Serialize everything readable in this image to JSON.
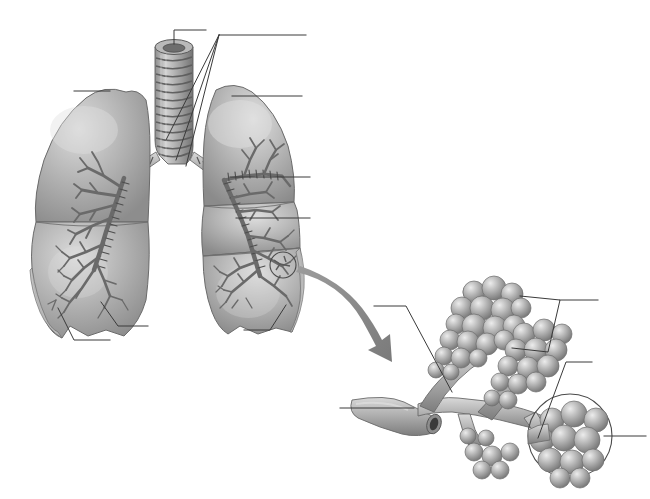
{
  "figure": {
    "style": "grayscale medical illustration, unlabeled worksheet",
    "background_color": "#ffffff",
    "width": 650,
    "height": 499,
    "cropped_header_text": "",
    "palette": {
      "lung_light": "#cfcfcf",
      "lung_mid": "#a9a9a9",
      "lung_shadow": "#7e7e7e",
      "bronchi": "#6f6f6f",
      "cartilage_light": "#c4c4c4",
      "cartilage_dark": "#6a6a6a",
      "alveoli_light": "#d8d8d8",
      "alveoli_mid": "#a5a5a5",
      "alveoli_shadow": "#777777",
      "leader_line": "#3a3a3a",
      "arrow": "#8a8a8a",
      "outline": "#555555"
    }
  },
  "panels": [
    {
      "id": "lungs-panel",
      "name": "Lungs with trachea and bronchial tree",
      "region": "left"
    },
    {
      "id": "alveoli-panel",
      "name": "Magnified alveolar sac cluster",
      "region": "lower-right"
    }
  ],
  "structures": {
    "trachea": "trachea with cartilage rings",
    "carina": "tracheal bifurcation",
    "primary_bronchus_left": "left primary bronchus",
    "primary_bronchus_right": "right primary bronchus",
    "left_lung": "left lung, two lobes",
    "right_lung": "right lung, three lobes",
    "bronchial_tree": "branching bronchi and bronchioles",
    "terminal_bronchiole": "terminal bronchiole",
    "alveolar_duct": "alveolar duct",
    "alveolar_sac": "alveolar sac",
    "alveoli": "alveoli cluster",
    "pulmonary_vessel": "pulmonary vessel stump"
  },
  "callouts": [
    {
      "id": "c1",
      "label": "",
      "target": "trachea-top",
      "style": "vertical-stub",
      "panel": "lungs-panel"
    },
    {
      "id": "c2",
      "label": "",
      "target": "bronchi-converging",
      "style": "converging-3",
      "panel": "lungs-panel"
    },
    {
      "id": "c3",
      "label": "",
      "target": "left-lung-apex",
      "style": "horizontal-left",
      "panel": "lungs-panel"
    },
    {
      "id": "c4",
      "label": "",
      "target": "right-lung-apex",
      "style": "horizontal-right",
      "panel": "lungs-panel"
    },
    {
      "id": "c5",
      "label": "",
      "target": "right-lung-bronchus-mid",
      "style": "horizontal-right",
      "panel": "lungs-panel"
    },
    {
      "id": "c6",
      "label": "",
      "target": "right-lung-bronchiole",
      "style": "horizontal-right",
      "panel": "lungs-panel"
    },
    {
      "id": "c7",
      "label": "",
      "target": "left-lung-base-lateral",
      "style": "diagonal-down",
      "panel": "lungs-panel"
    },
    {
      "id": "c8",
      "label": "",
      "target": "left-lung-base-medial",
      "style": "diagonal-down",
      "panel": "lungs-panel"
    },
    {
      "id": "c9",
      "label": "",
      "target": "right-lung-base",
      "style": "diagonal-down",
      "panel": "lungs-panel"
    },
    {
      "id": "c10",
      "label": "",
      "target": "alveolar-duct",
      "style": "diagonal-left",
      "panel": "alveoli-panel"
    },
    {
      "id": "c11",
      "label": "",
      "target": "alveolar-sacs-bracket",
      "style": "bracket",
      "panel": "alveoli-panel"
    },
    {
      "id": "c12",
      "label": "",
      "target": "alveolar-sac-lower",
      "style": "diagonal-right",
      "panel": "alveoli-panel"
    },
    {
      "id": "c13",
      "label": "",
      "target": "terminal-bronchiole",
      "style": "horizontal-left",
      "panel": "alveoli-panel"
    },
    {
      "id": "c14",
      "label": "",
      "target": "alveoli-magnified-circle",
      "style": "horizontal-right",
      "panel": "alveoli-panel"
    }
  ],
  "markers": {
    "magnifier_circle_on_lung": "small circle marking magnified region on right lung",
    "magnifier_circle_on_alveoli": "large circle enclosing magnified alveoli cluster",
    "zoom_arrow": "curved arrow from lung detail to alveoli panel"
  }
}
